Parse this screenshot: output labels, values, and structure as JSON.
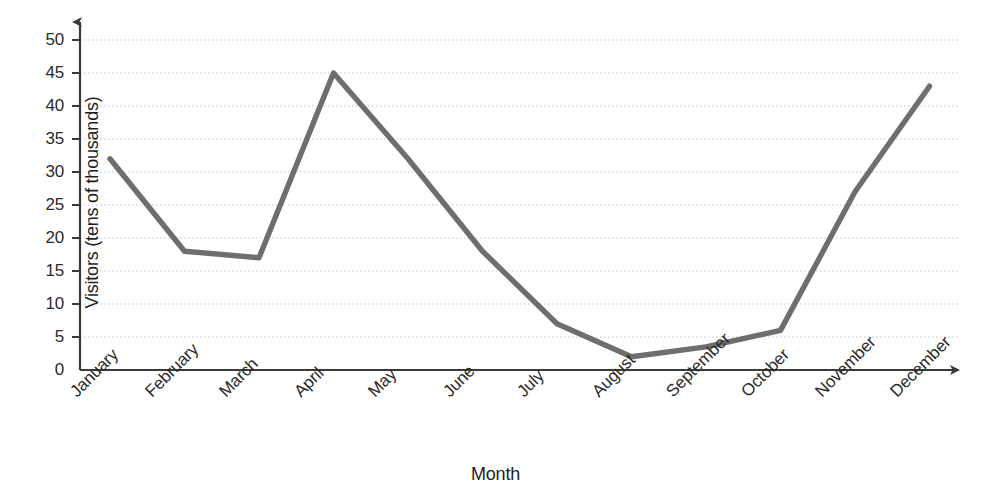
{
  "chart_data": {
    "type": "line",
    "title": "",
    "xlabel": "Month",
    "ylabel": "Visitors (tens of thousands)",
    "categories": [
      "January",
      "February",
      "March",
      "April",
      "May",
      "June",
      "July",
      "August",
      "September",
      "October",
      "November",
      "December"
    ],
    "values": [
      32,
      18,
      17,
      45,
      32,
      18,
      7,
      2,
      3.5,
      6,
      27,
      43
    ],
    "series": [
      {
        "name": "Visitors",
        "values": [
          32,
          18,
          17,
          45,
          32,
          18,
          7,
          2,
          3.5,
          6,
          27,
          43
        ]
      }
    ],
    "ylim": [
      0,
      50
    ],
    "ytick_labels": [
      "0",
      "5",
      "10",
      "15",
      "20",
      "25",
      "30",
      "35",
      "40",
      "45",
      "50"
    ],
    "ytick_values": [
      0,
      5,
      10,
      15,
      20,
      25,
      30,
      35,
      40,
      45,
      50
    ],
    "grid": true,
    "grid_axis": "y",
    "legend": "none",
    "line_color": "#6e6e6e",
    "grid_color": "#b9c6d6",
    "axis_color": "#3a3a3a",
    "text_color": "#2b2b2b",
    "background": "#ffffff",
    "markers": false,
    "axis_arrows": true
  }
}
